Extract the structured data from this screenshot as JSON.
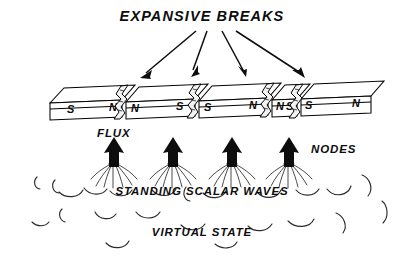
{
  "figure": {
    "title": "EXPANSIVE BREAKS",
    "labels": {
      "flux": "FLUX",
      "nodes": "NODES",
      "standing_waves": "STANDING SCALAR WAVES",
      "virtual_state": "VIRTUAL STATE"
    },
    "colors": {
      "ink": "#0d0d0d",
      "line": "#000000",
      "background": "#ffffff",
      "crack_fill": "#f2f2f2",
      "cloud_stroke": "#2a2a2a"
    },
    "magnet": {
      "segment_count": 5,
      "break_count": 4,
      "pole_sequence": [
        "S",
        "N",
        "N",
        "S",
        "S",
        "N",
        "N",
        "S",
        "S",
        "N"
      ],
      "segments": [
        {
          "left_pole": "S",
          "right_pole": "N"
        },
        {
          "left_pole": "N",
          "right_pole": "S"
        },
        {
          "left_pole": "S",
          "right_pole": "N"
        },
        {
          "left_pole": "N",
          "right_pole": "S"
        },
        {
          "left_pole": "S",
          "right_pole": "N"
        }
      ]
    },
    "flux_nodes": {
      "count": 4,
      "direction": "up"
    },
    "title_arrows": {
      "count": 4
    }
  }
}
